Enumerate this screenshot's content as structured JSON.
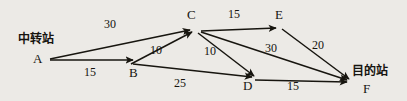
{
  "diagram": {
    "title": "",
    "background_color": "#eceae6",
    "line_color": "#17150f",
    "nodes": [
      {
        "id": "A",
        "label": "A",
        "x": 38,
        "y": 64
      },
      {
        "id": "B",
        "label": "B",
        "x": 132,
        "y": 78
      },
      {
        "id": "C",
        "label": "C",
        "x": 190,
        "y": 19
      },
      {
        "id": "D",
        "label": "D",
        "x": 246,
        "y": 90
      },
      {
        "id": "E",
        "label": "E",
        "x": 278,
        "y": 20
      },
      {
        "id": "F",
        "label": "F",
        "x": 364,
        "y": 94
      }
    ],
    "annotations": [
      {
        "name": "source-station-label",
        "text": "中转站",
        "x": 18,
        "y": 39
      },
      {
        "name": "destination-station-label",
        "text": "目的站",
        "x": 352,
        "y": 71
      }
    ],
    "edges": [
      {
        "from": "A",
        "to": "C",
        "weight": "30",
        "label_x": 104,
        "label_y": 22
      },
      {
        "from": "A",
        "to": "B",
        "weight": "15",
        "label_x": 84,
        "label_y": 63
      },
      {
        "from": "B",
        "to": "C",
        "weight": "10",
        "label_x": 150,
        "label_y": 44
      },
      {
        "from": "B",
        "to": "D",
        "weight": "25",
        "label_x": 174,
        "label_y": 76
      },
      {
        "from": "C",
        "to": "D",
        "weight": "10",
        "label_x": 204,
        "label_y": 44
      },
      {
        "from": "C",
        "to": "E",
        "weight": "15",
        "label_x": 227,
        "label_y": 7
      },
      {
        "from": "C",
        "to": "F",
        "weight": "30",
        "label_x": 264,
        "label_y": 41
      },
      {
        "from": "E",
        "to": "F",
        "weight": "20",
        "label_x": 311,
        "label_y": 38
      },
      {
        "from": "D",
        "to": "F",
        "weight": "15",
        "label_x": 286,
        "label_y": 79
      }
    ]
  }
}
